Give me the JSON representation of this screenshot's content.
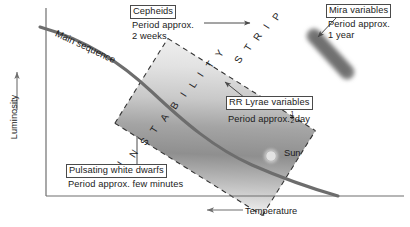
{
  "figure": {
    "kind": "hr-diagram"
  },
  "axes": {
    "y": {
      "label": "Luminosity",
      "direction": "up-arrow"
    },
    "x": {
      "label": "Temperature",
      "direction": "left-arrow"
    }
  },
  "strip": {
    "label": "INSTABILITY STRIP",
    "letters": [
      "I",
      "N",
      "S",
      "T",
      "A",
      "B",
      "I",
      "L",
      "I",
      "T",
      "Y",
      "S",
      "T",
      "R",
      "I",
      "P"
    ],
    "border": "dashed"
  },
  "curves": {
    "main_sequence": {
      "label": "Main sequence"
    }
  },
  "markers": {
    "sun": {
      "label": "Sun"
    },
    "mira_clump": {
      "label": ""
    }
  },
  "callouts": [
    {
      "id": "cepheids",
      "title": "Cepheids",
      "line2": "Period approx.",
      "line3": "2 weeks"
    },
    {
      "id": "mira-variables",
      "title": "Mira variables",
      "line2": "Period approx.",
      "line3": "1 year"
    },
    {
      "id": "rr-lyrae",
      "title": "RR Lyrae variables",
      "line2_prefix": "Period approx.",
      "line2_fraction_num": "1",
      "line2_fraction_den": "2",
      "line2_suffix": "day"
    },
    {
      "id": "pulsating-white-dwarfs",
      "title": "Pulsating white dwarfs",
      "line2": "Period approx. few minutes"
    }
  ],
  "colors": {
    "ink": "#1b1b1b",
    "curve": "#6d6d6d",
    "axis": "#6f6f6f",
    "strip_dark": "#8e8e8e",
    "strip_light": "#e8e8e8",
    "mira": "#8a8a8a",
    "box_border": "#4a4a4a"
  }
}
